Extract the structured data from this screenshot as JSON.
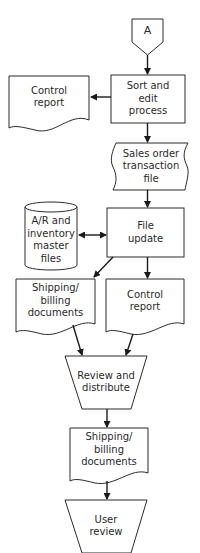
{
  "diagram": {
    "type": "flowchart",
    "nodes": [
      {
        "id": "connector_a",
        "shape": "off-page-connector",
        "label": "A"
      },
      {
        "id": "sort_edit",
        "shape": "process",
        "label": "Sort and\nedit\nprocess"
      },
      {
        "id": "control_report_1",
        "shape": "document",
        "label": "Control\nreport"
      },
      {
        "id": "sales_order_file",
        "shape": "punched-tape",
        "label": "Sales order\ntransaction\nfile"
      },
      {
        "id": "file_update",
        "shape": "process",
        "label": "File\nupdate"
      },
      {
        "id": "master_files",
        "shape": "disk-storage",
        "label": "A/R and\ninventory\nmaster\nfiles"
      },
      {
        "id": "shipping_docs_1",
        "shape": "document",
        "label": "Shipping/\nbilling\ndocuments"
      },
      {
        "id": "control_report_2",
        "shape": "document",
        "label": "Control\nreport"
      },
      {
        "id": "review_distribute",
        "shape": "manual-operation",
        "label": "Review and\ndistribute"
      },
      {
        "id": "shipping_docs_2",
        "shape": "document",
        "label": "Shipping/\nbilling\ndocuments"
      },
      {
        "id": "user_review",
        "shape": "manual-operation",
        "label": "User\nreview"
      }
    ],
    "edges": [
      {
        "from": "connector_a",
        "to": "sort_edit"
      },
      {
        "from": "sort_edit",
        "to": "control_report_1"
      },
      {
        "from": "sort_edit",
        "to": "sales_order_file"
      },
      {
        "from": "sales_order_file",
        "to": "file_update"
      },
      {
        "from": "file_update",
        "to": "master_files",
        "bidirectional": true
      },
      {
        "from": "file_update",
        "to": "shipping_docs_1"
      },
      {
        "from": "file_update",
        "to": "control_report_2"
      },
      {
        "from": "shipping_docs_1",
        "to": "review_distribute"
      },
      {
        "from": "control_report_2",
        "to": "review_distribute"
      },
      {
        "from": "review_distribute",
        "to": "shipping_docs_2"
      },
      {
        "from": "shipping_docs_2",
        "to": "user_review"
      }
    ]
  },
  "labels": {
    "connector_a": "A",
    "sort_edit": "Sort and\nedit\nprocess",
    "control_report_1": "Control\nreport",
    "sales_order_file": "Sales order\ntransaction\nfile",
    "file_update": "File\nupdate",
    "master_files": "A/R and\ninventory\nmaster\nfiles",
    "shipping_docs_1": "Shipping/\nbilling\ndocuments",
    "control_report_2": "Control\nreport",
    "review_distribute": "Review and\ndistribute",
    "shipping_docs_2": "Shipping/\nbilling\ndocuments",
    "user_review": "User\nreview"
  },
  "colors": {
    "stroke": "#2b2b2b",
    "fill": "#ffffff",
    "text": "#2a2a2a"
  }
}
